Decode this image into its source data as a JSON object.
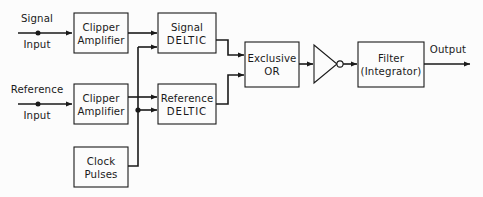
{
  "diagram": {
    "background_color": "#fcfcfc",
    "line_color": "#1a1a1a",
    "blocks": [
      {
        "id": "signal_clipper",
        "line1": "Clipper",
        "line2": "Amplifier"
      },
      {
        "id": "reference_clipper",
        "line1": "Clipper",
        "line2": "Amplifier"
      },
      {
        "id": "signal_deltic",
        "line1": "Signal",
        "line2": "DELTIC"
      },
      {
        "id": "reference_deltic",
        "line1": "Reference",
        "line2": "DELTIC"
      },
      {
        "id": "clock_pulses",
        "line1": "Clock",
        "line2": "Pulses"
      },
      {
        "id": "exclusive_or",
        "line1": "Exclusive",
        "line2": "OR"
      },
      {
        "id": "filter",
        "line1": "Filter",
        "line2": "(Integrator)"
      }
    ],
    "ports": [
      {
        "id": "signal_input",
        "line1": "Signal",
        "line2": "Input"
      },
      {
        "id": "reference_input",
        "line1": "Reference",
        "line2": "Input"
      }
    ],
    "output": {
      "id": "output",
      "label": "Output"
    },
    "inverter": {
      "id": "inverter",
      "label": ""
    }
  }
}
